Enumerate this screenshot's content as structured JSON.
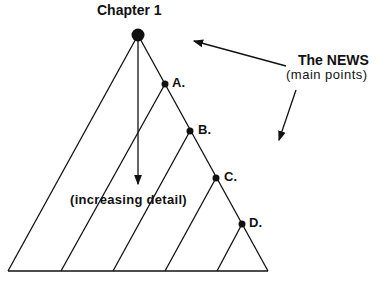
{
  "diagram": {
    "title": "Chapter 1",
    "points": [
      {
        "label": "A."
      },
      {
        "label": "B."
      },
      {
        "label": "C."
      },
      {
        "label": "D."
      }
    ],
    "news_label": "The NEWS",
    "news_sublabel": "(main points)",
    "detail_label": "(increasing detail)",
    "line_color": "#111111"
  }
}
